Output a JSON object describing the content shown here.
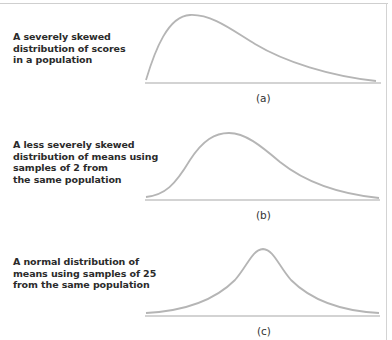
{
  "figure": {
    "panels": [
      {
        "id": "a",
        "caption": "(a)",
        "description_lines": [
          "A severely skewed",
          "distribution of scores",
          "in a population"
        ],
        "curve_type": "severely-skewed"
      },
      {
        "id": "b",
        "caption": "(b)",
        "description_lines": [
          "A less severely skewed",
          "distribution of means using",
          "samples of 2 from",
          "the same population"
        ],
        "curve_type": "moderately-skewed"
      },
      {
        "id": "c",
        "caption": "(c)",
        "description_lines": [
          "A normal distribution of",
          "means using samples of 25",
          "from the same population"
        ],
        "curve_type": "normal"
      }
    ],
    "colors": {
      "curve": "#b5b5b5",
      "baseline": "#c4c4c4",
      "text": "#2b2b2b"
    }
  }
}
